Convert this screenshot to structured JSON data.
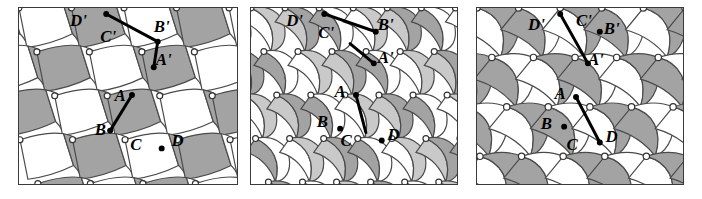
{
  "figure": {
    "caption": "",
    "background": "#ffffff",
    "panel_border_color": "#3a3a3a"
  },
  "colors": {
    "white_tile": "#ffffff",
    "light_gray_tile": "#c9c9c9",
    "mid_gray_tile": "#a3a3a3",
    "dark_gray_tile": "#9a9a9a",
    "outline": "#4a4a4a",
    "vertex_fill": "#ffffff",
    "vertex_stroke": "#333333",
    "marker": "#000000",
    "label": "#000000"
  },
  "panels": [
    {
      "id": "panel-1",
      "name": "tiling-panel-left",
      "tile_style": "quadrilateral",
      "shades": [
        "#ffffff",
        "#a3a3a3"
      ],
      "labels": [
        {
          "text": "D'",
          "x": 30,
          "y": 9
        },
        {
          "text": "C'",
          "x": 45,
          "y": 17
        },
        {
          "text": "B'",
          "x": 72,
          "y": 12
        },
        {
          "text": "A'",
          "x": 73,
          "y": 29
        },
        {
          "text": "A",
          "x": 51,
          "y": 47
        },
        {
          "text": "B",
          "x": 41,
          "y": 64
        },
        {
          "text": "C",
          "x": 59,
          "y": 72
        },
        {
          "text": "D",
          "x": 80,
          "y": 70
        }
      ],
      "arrows": [
        {
          "from": [
            44,
            3
          ],
          "to": [
            70,
            17
          ]
        },
        {
          "from": [
            70,
            17
          ],
          "to": [
            68,
            30
          ]
        },
        {
          "from": [
            57,
            44
          ],
          "to": [
            46,
            62
          ]
        }
      ],
      "markers": [
        [
          44,
          3
        ],
        [
          70,
          17
        ],
        [
          68,
          30
        ],
        [
          57,
          44
        ],
        [
          46,
          62
        ],
        [
          72,
          71
        ]
      ]
    },
    {
      "id": "panel-2",
      "name": "tiling-panel-middle",
      "tile_style": "curved-lens",
      "shades": [
        "#ffffff",
        "#c9c9c9",
        "#a3a3a3"
      ],
      "labels": [
        {
          "text": "D'",
          "x": 22,
          "y": 9
        },
        {
          "text": "C'",
          "x": 38,
          "y": 15
        },
        {
          "text": "B'",
          "x": 68,
          "y": 11
        },
        {
          "text": "A'",
          "x": 68,
          "y": 28
        },
        {
          "text": "A",
          "x": 45,
          "y": 45
        },
        {
          "text": "B",
          "x": 36,
          "y": 60
        },
        {
          "text": "C",
          "x": 48,
          "y": 70
        },
        {
          "text": "D",
          "x": 72,
          "y": 67
        }
      ],
      "arrows": [
        {
          "from": [
            37,
            3
          ],
          "to": [
            63,
            12
          ]
        },
        {
          "from": [
            50,
            18
          ],
          "to": [
            62,
            28
          ]
        },
        {
          "from": [
            53,
            44
          ],
          "to": [
            58,
            63
          ]
        }
      ],
      "markers": [
        [
          37,
          3
        ],
        [
          63,
          12
        ],
        [
          62,
          28
        ],
        [
          53,
          44
        ],
        [
          45,
          61
        ],
        [
          66,
          67
        ]
      ]
    },
    {
      "id": "panel-3",
      "name": "tiling-panel-right",
      "tile_style": "s-curve-leaf",
      "shades": [
        "#ffffff",
        "#a3a3a3"
      ],
      "labels": [
        {
          "text": "D'",
          "x": 30,
          "y": 11
        },
        {
          "text": "C'",
          "x": 54,
          "y": 9
        },
        {
          "text": "B'",
          "x": 68,
          "y": 13
        },
        {
          "text": "A'",
          "x": 60,
          "y": 29
        },
        {
          "text": "A",
          "x": 42,
          "y": 46
        },
        {
          "text": "B",
          "x": 35,
          "y": 61
        },
        {
          "text": "C",
          "x": 48,
          "y": 72
        },
        {
          "text": "D",
          "x": 68,
          "y": 68
        }
      ],
      "arrows": [
        {
          "from": [
            42,
            3
          ],
          "to": [
            56,
            28
          ]
        },
        {
          "from": [
            50,
            45
          ],
          "to": [
            62,
            68
          ]
        }
      ],
      "markers": [
        [
          42,
          3
        ],
        [
          56,
          28
        ],
        [
          50,
          45
        ],
        [
          62,
          68
        ],
        [
          62,
          12
        ],
        [
          44,
          60
        ]
      ]
    }
  ],
  "vertex_markers_note": "small white circles outlined dark mark tiling vertices"
}
